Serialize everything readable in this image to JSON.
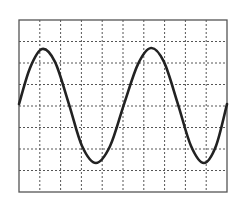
{
  "chart_data": {
    "type": "line",
    "title": "",
    "xlabel": "",
    "ylabel": "",
    "grid": true,
    "grid_style": "dotted",
    "x_divisions": 10,
    "y_divisions": 8,
    "xlim": [
      0,
      10
    ],
    "ylim": [
      -4,
      4
    ],
    "series": [
      {
        "name": "waveform",
        "color": "#222222",
        "x": [
          0,
          0.53,
          1.11,
          1.73,
          2.4,
          3.03,
          3.7,
          4.38,
          5.05,
          5.72,
          6.35,
          6.97,
          7.64,
          8.27,
          8.89,
          9.47,
          10
        ],
        "y": [
          0.09,
          1.77,
          2.65,
          2.05,
          0.09,
          -1.86,
          -2.65,
          -1.86,
          0.09,
          1.95,
          2.7,
          2.05,
          0.09,
          -1.86,
          -2.65,
          -1.86,
          0.09
        ]
      }
    ],
    "amplitude_divisions": 2.65,
    "period_divisions": 5.2
  },
  "frame": {
    "left": 19,
    "top": 20,
    "right": 227,
    "bottom": 192,
    "border_color": "#555555",
    "grid_color": "#555555",
    "background": "#ffffff"
  }
}
